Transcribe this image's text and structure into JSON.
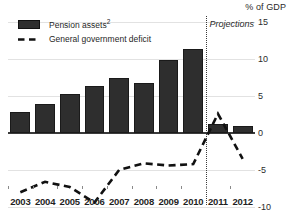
{
  "chart_data": {
    "type": "bar",
    "title": "",
    "subtitle": "",
    "xlabel": "",
    "ylabel": "% of GDP",
    "ylim": [
      -10,
      15
    ],
    "yticks": [
      15,
      10,
      5,
      0,
      -5,
      -10
    ],
    "ytick_labels": [
      "15",
      "10",
      "5",
      "0",
      "-5",
      "-10"
    ],
    "grid": true,
    "legend_position": "top-left",
    "categories": [
      "2003",
      "2004",
      "2005",
      "2006",
      "2007",
      "2008",
      "2009",
      "2010",
      "2011",
      "2012"
    ],
    "series": [
      {
        "name": "Pension assets²",
        "type": "bar",
        "values": [
          2.9,
          3.9,
          5.3,
          6.4,
          7.4,
          6.7,
          9.8,
          11.3,
          1.2,
          1.0
        ]
      },
      {
        "name": "General government deficit",
        "type": "line",
        "style": "dashed",
        "values": [
          -8.0,
          -6.6,
          -7.3,
          -9.4,
          -5.0,
          -4.1,
          -4.4,
          -4.2,
          2.6,
          -3.5
        ]
      }
    ],
    "annotations": [
      {
        "name": "projections-divider",
        "label": "Projections",
        "x_between": [
          "2010",
          "2011"
        ],
        "style": "dotted-vertical"
      }
    ],
    "colors": {
      "bar": "#2e2e2e",
      "line": "#111111",
      "grid": "#e2e2e2",
      "axis": "#3b3b3b",
      "text": "#1f1f1f"
    }
  },
  "legend": {
    "items": [
      {
        "label": "Pension assets",
        "superscript": "2",
        "marker": "bar-swatch"
      },
      {
        "label": "General government deficit",
        "superscript": "",
        "marker": "dashed-line"
      }
    ]
  },
  "axis": {
    "unit_label": "% of GDP"
  }
}
